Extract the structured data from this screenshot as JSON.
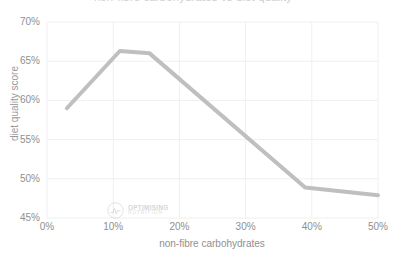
{
  "chart_data": {
    "type": "line",
    "title": "non-fibre carbohydrates vs diet quality",
    "xlabel": "non-fibre carbohydrates",
    "ylabel": "diet quality score",
    "xlim": [
      0,
      50
    ],
    "ylim": [
      45,
      70
    ],
    "x_ticks": [
      "0%",
      "10%",
      "20%",
      "30%",
      "40%",
      "50%"
    ],
    "x_tick_values": [
      0,
      10,
      20,
      30,
      40,
      50
    ],
    "y_ticks": [
      "45%",
      "50%",
      "55%",
      "60%",
      "65%",
      "70%"
    ],
    "y_tick_values": [
      45,
      50,
      55,
      60,
      65,
      70
    ],
    "grid": true,
    "legend": "none",
    "line_color": "#bfbfbf",
    "line_width": 4,
    "series": [
      {
        "name": "diet quality score",
        "x": [
          3.0,
          11.0,
          15.5,
          39.0,
          50.0
        ],
        "values": [
          59.0,
          66.3,
          66.0,
          48.9,
          47.9
        ]
      }
    ]
  },
  "watermark": {
    "logo_icon": "optimising-nutrition-logo-icon",
    "line1": "OPTIMISING",
    "line2": "NUTRITION"
  }
}
